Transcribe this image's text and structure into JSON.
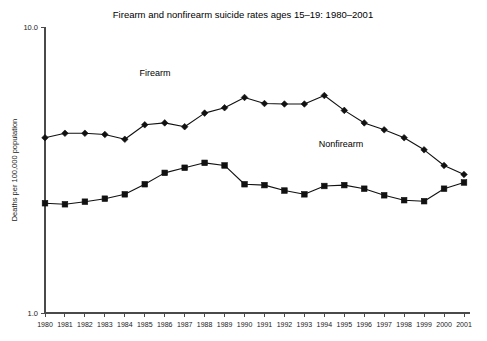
{
  "chart_data": {
    "type": "line",
    "title": "Firearm and nonfirearm suicide rates ages 15–19: 1980–2001",
    "xlabel": "",
    "ylabel": "Deaths per 100,000 population",
    "yscale": "log",
    "ylim": [
      1.0,
      10.0
    ],
    "ytick_labels": [
      "10.0",
      "1.0"
    ],
    "ytick_values": [
      10.0,
      1.0
    ],
    "grid": false,
    "legend_position": "inline-annotations",
    "categories": [
      "1980",
      "1981",
      "1982",
      "1983",
      "1984",
      "1985",
      "1986",
      "1987",
      "1988",
      "1989",
      "1990",
      "1991",
      "1992",
      "1993",
      "1994",
      "1995",
      "1996",
      "1997",
      "1998",
      "1999",
      "2000",
      "2001"
    ],
    "series": [
      {
        "name": "Firearm",
        "marker": "diamond",
        "color": "#111111",
        "values": [
          4.1,
          4.25,
          4.25,
          4.21,
          4.05,
          4.55,
          4.62,
          4.48,
          5.0,
          5.22,
          5.67,
          5.4,
          5.38,
          5.38,
          5.76,
          5.11,
          4.62,
          4.37,
          4.1,
          3.72,
          3.28,
          3.05
        ]
      },
      {
        "name": "Nonfirearm",
        "marker": "square",
        "color": "#111111",
        "values": [
          2.42,
          2.4,
          2.45,
          2.51,
          2.6,
          2.82,
          3.09,
          3.22,
          3.35,
          3.28,
          2.82,
          2.8,
          2.68,
          2.6,
          2.78,
          2.8,
          2.72,
          2.58,
          2.48,
          2.46,
          2.72,
          2.86
        ]
      }
    ],
    "annotations": [
      {
        "text": "Firearm",
        "series": "Firearm"
      },
      {
        "text": "Nonfirearm",
        "series": "Nonfirearm"
      }
    ]
  }
}
